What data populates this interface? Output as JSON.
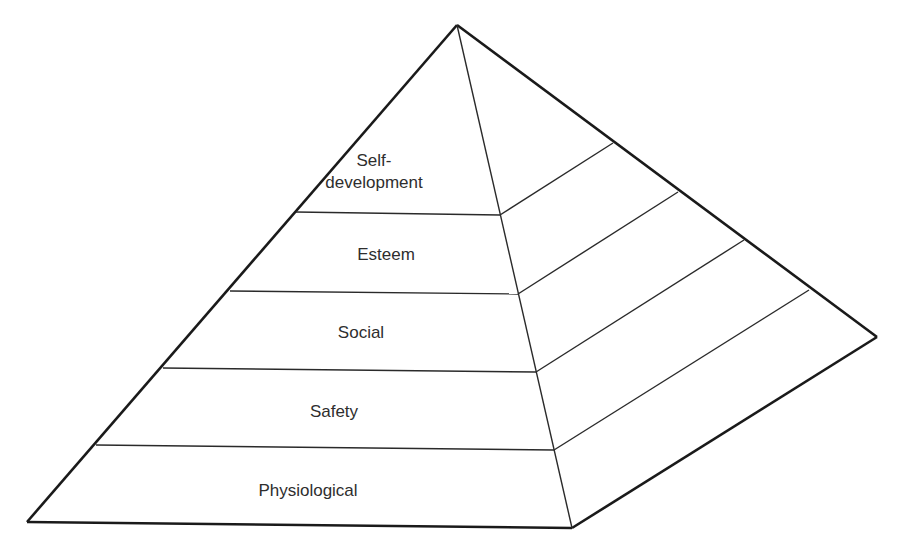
{
  "diagram": {
    "type": "pyramid",
    "levels": [
      {
        "label_line1": "Self-",
        "label_line2": "development"
      },
      {
        "label": "Esteem"
      },
      {
        "label": "Social"
      },
      {
        "label": "Safety"
      },
      {
        "label": "Physiological"
      }
    ],
    "colors": {
      "line": "#1a1a1a",
      "text": "#2e2e2e",
      "background": "#ffffff"
    }
  }
}
